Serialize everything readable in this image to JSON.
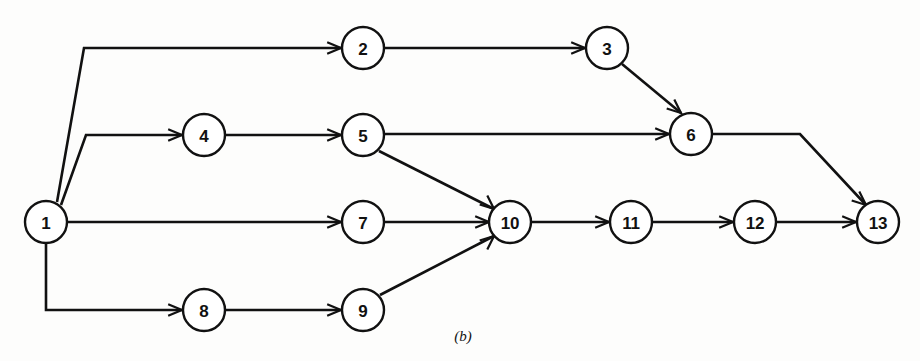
{
  "figure": {
    "caption": "(b)",
    "caption_x": 463,
    "caption_y": 341,
    "width": 920,
    "height": 361,
    "background_color": "#fdfdfc",
    "line_color": "#111111",
    "node_fill_color": "#ffffff"
  },
  "diagram": {
    "type": "directed-graph",
    "node_radius": 21,
    "nodes": [
      {
        "id": "1",
        "label": "1",
        "cx": 46,
        "cy": 222
      },
      {
        "id": "2",
        "label": "2",
        "cx": 363,
        "cy": 48
      },
      {
        "id": "3",
        "label": "3",
        "cx": 607,
        "cy": 48
      },
      {
        "id": "4",
        "label": "4",
        "cx": 204,
        "cy": 135
      },
      {
        "id": "5",
        "label": "5",
        "cx": 363,
        "cy": 135
      },
      {
        "id": "6",
        "label": "6",
        "cx": 691,
        "cy": 134
      },
      {
        "id": "7",
        "label": "7",
        "cx": 363,
        "cy": 222
      },
      {
        "id": "8",
        "label": "8",
        "cx": 204,
        "cy": 310
      },
      {
        "id": "9",
        "label": "9",
        "cx": 363,
        "cy": 310
      },
      {
        "id": "10",
        "label": "10",
        "cx": 510,
        "cy": 222
      },
      {
        "id": "11",
        "label": "11",
        "cx": 631,
        "cy": 222
      },
      {
        "id": "12",
        "label": "12",
        "cx": 755,
        "cy": 222
      },
      {
        "id": "13",
        "label": "13",
        "cx": 878,
        "cy": 222
      }
    ],
    "edges": [
      {
        "from": "1",
        "to": "2",
        "points": "57,202 84,48 341,48",
        "arrow_at": "341,48",
        "arrow_dir": "right"
      },
      {
        "from": "1",
        "to": "4",
        "points": "61,205 86,135 182,135",
        "arrow_at": "182,135",
        "arrow_dir": "right"
      },
      {
        "from": "1",
        "to": "7",
        "points": "67,222 341,222",
        "arrow_at": "341,222",
        "arrow_dir": "right"
      },
      {
        "from": "1",
        "to": "8",
        "points": "46,243 46,310 182,310",
        "arrow_at": "182,310",
        "arrow_dir": "right"
      },
      {
        "from": "2",
        "to": "3",
        "points": "385,48 585,48",
        "arrow_at": "585,48",
        "arrow_dir": "right"
      },
      {
        "from": "3",
        "to": "6",
        "points": "622,64 681,113",
        "arrow_at": "681,113",
        "arrow_dir": "down-right"
      },
      {
        "from": "4",
        "to": "5",
        "points": "226,135 341,135",
        "arrow_at": "341,135",
        "arrow_dir": "right"
      },
      {
        "from": "5",
        "to": "6",
        "points": "385,134 669,134",
        "arrow_at": "669,134",
        "arrow_dir": "right"
      },
      {
        "from": "5",
        "to": "10",
        "points": "379,151 494,209",
        "arrow_at": "494,209",
        "arrow_dir": "down-right"
      },
      {
        "from": "6",
        "to": "13",
        "points": "713,134 800,134 866,205",
        "arrow_at": "866,205",
        "arrow_dir": "down-right"
      },
      {
        "from": "7",
        "to": "10",
        "points": "385,222 489,222",
        "arrow_at": "489,222",
        "arrow_dir": "right"
      },
      {
        "from": "8",
        "to": "9",
        "points": "226,310 341,310",
        "arrow_at": "341,310",
        "arrow_dir": "right"
      },
      {
        "from": "9",
        "to": "10",
        "points": "380,295 494,236",
        "arrow_at": "494,236",
        "arrow_dir": "up-right"
      },
      {
        "from": "10",
        "to": "11",
        "points": "532,222 609,222",
        "arrow_at": "609,222",
        "arrow_dir": "right"
      },
      {
        "from": "11",
        "to": "12",
        "points": "653,222 733,222",
        "arrow_at": "733,222",
        "arrow_dir": "right"
      },
      {
        "from": "12",
        "to": "13",
        "points": "777,222 856,222",
        "arrow_at": "856,222",
        "arrow_dir": "right"
      }
    ]
  }
}
